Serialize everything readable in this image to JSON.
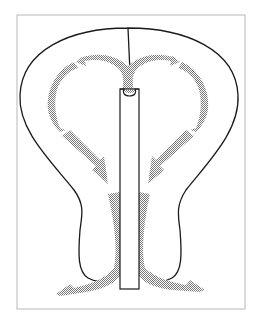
{
  "figure": {
    "colors": {
      "background": "#ffffff",
      "frame": "#b8b8b8",
      "outline": "#1a1a1a",
      "flow": "#8c8c8c"
    },
    "elements": [
      "frame",
      "chamber-outline",
      "tube",
      "tube-cap",
      "flow-arrows"
    ],
    "flow_arrows": [
      {
        "name": "flow-up-from-tube",
        "direction": "up"
      },
      {
        "name": "flow-top-left",
        "direction": "left"
      },
      {
        "name": "flow-top-right",
        "direction": "right"
      },
      {
        "name": "flow-left-side",
        "direction": "down"
      },
      {
        "name": "flow-right-side",
        "direction": "down"
      },
      {
        "name": "flow-left-diagonal",
        "direction": "down-right"
      },
      {
        "name": "flow-right-diagonal",
        "direction": "down-left"
      },
      {
        "name": "flow-bottom-left-exit",
        "direction": "left"
      },
      {
        "name": "flow-bottom-right-exit",
        "direction": "right"
      }
    ]
  }
}
